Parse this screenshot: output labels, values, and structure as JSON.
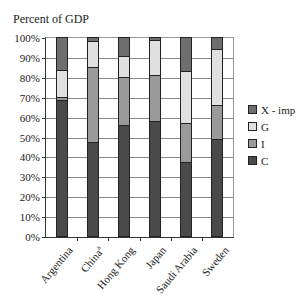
{
  "chart_data": {
    "type": "bar",
    "stacked": true,
    "title": "",
    "ylabel": "Percent of GDP",
    "xlabel": "",
    "ylim": [
      0,
      100
    ],
    "yticks": [
      "0%",
      "10%",
      "20%",
      "30%",
      "40%",
      "50%",
      "60%",
      "70%",
      "80%",
      "90%",
      "100%"
    ],
    "grid": true,
    "legend_position": "right",
    "categories": [
      "Argentina",
      "China",
      "Hong Kong",
      "Japan",
      "Saudi Arabia",
      "Sweden"
    ],
    "category_superscripts": [
      "",
      "a",
      "",
      "",
      "",
      ""
    ],
    "series": [
      {
        "name": "C",
        "color": "#4a4a4a",
        "values": [
          68.5,
          47,
          56,
          58,
          37,
          49
        ]
      },
      {
        "name": "I",
        "color": "#9a9a9a",
        "values": [
          1.5,
          38,
          24,
          23,
          20,
          17
        ]
      },
      {
        "name": "G",
        "color": "#e0e0e0",
        "values": [
          13.5,
          13,
          10.5,
          17.5,
          26,
          28
        ]
      },
      {
        "name": "X - imp",
        "color": "#6e6e6e",
        "values": [
          16.5,
          2,
          9.5,
          1.5,
          17,
          6
        ]
      }
    ],
    "legend_order": [
      "X - imp",
      "G",
      "I",
      "C"
    ]
  },
  "labels": {
    "y_title": "Percent of GDP"
  }
}
